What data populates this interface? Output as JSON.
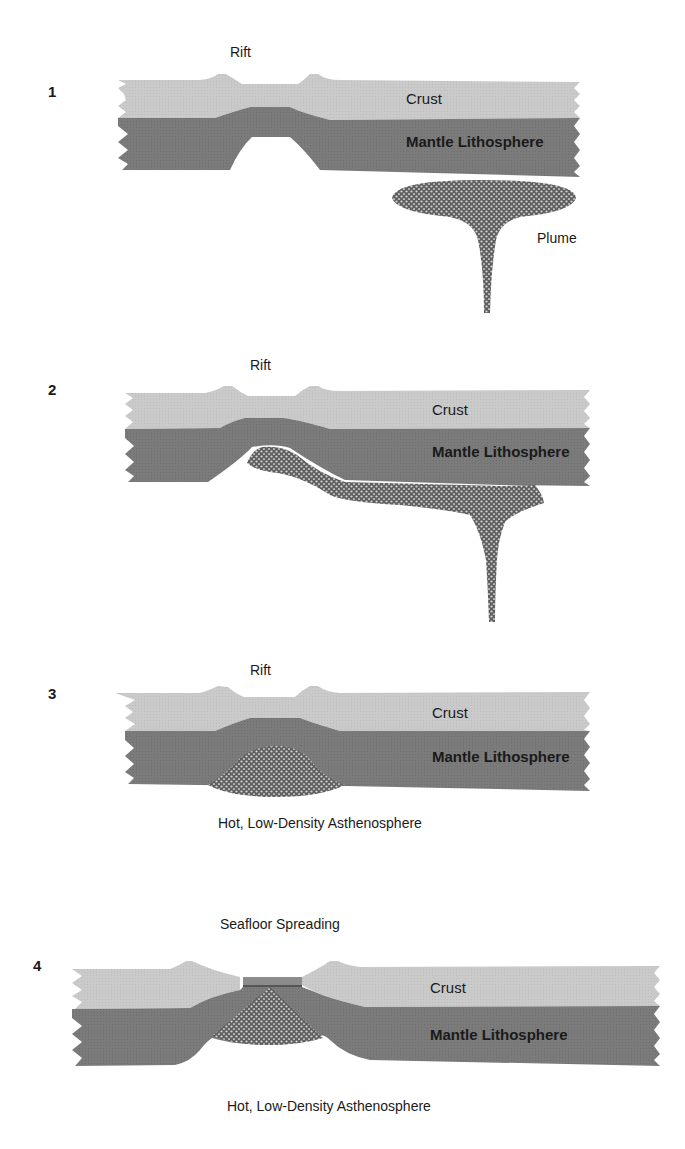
{
  "figure": {
    "colors": {
      "crust": "#c9c9c9",
      "mantle_lithosphere": "#7a7a7a",
      "plume": "#6a6a6a",
      "plume_dots": "#d8d8d8",
      "text": "#1a1a1a",
      "background": "#ffffff"
    }
  },
  "panels": [
    {
      "number": "1",
      "top_label": "Rift",
      "crust_label": "Crust",
      "mantle_label": "Mantle Lithosphere",
      "side_label": "Plume",
      "bottom_label": ""
    },
    {
      "number": "2",
      "top_label": "Rift",
      "crust_label": "Crust",
      "mantle_label": "Mantle Lithosphere",
      "side_label": "",
      "bottom_label": ""
    },
    {
      "number": "3",
      "top_label": "Rift",
      "crust_label": "Crust",
      "mantle_label": "Mantle Lithosphere",
      "side_label": "",
      "bottom_label": "Hot, Low-Density Asthenosphere"
    },
    {
      "number": "4",
      "top_label": "Seafloor Spreading",
      "crust_label": "Crust",
      "mantle_label": "Mantle Lithosphere",
      "side_label": "",
      "bottom_label": "Hot, Low-Density Asthenosphere"
    }
  ]
}
